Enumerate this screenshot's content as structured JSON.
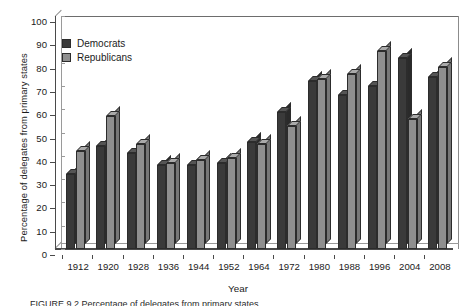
{
  "chart_data": {
    "type": "bar",
    "title": "",
    "xlabel": "Year",
    "ylabel": "Percentage of delegates from primary states",
    "categories": [
      "1912",
      "1920",
      "1928",
      "1936",
      "1944",
      "1952",
      "1964",
      "1972",
      "1980",
      "1988",
      "1996",
      "2004",
      "2008"
    ],
    "series": [
      {
        "name": "Democrats",
        "color": "#3a3a3a",
        "values": [
          32,
          44,
          41,
          36,
          36,
          37,
          46,
          59,
          72,
          66,
          70,
          82,
          74
        ]
      },
      {
        "name": "Republicans",
        "color": "#8f8f8f",
        "values": [
          42,
          57,
          45,
          37,
          38,
          39,
          45,
          53,
          73,
          75,
          85,
          56,
          78
        ]
      }
    ],
    "ylim": [
      0,
      100
    ],
    "yticks": [
      0,
      10,
      20,
      30,
      40,
      50,
      60,
      70,
      80,
      90,
      100
    ],
    "ytick_labels": [
      "0",
      "10",
      "20",
      "30",
      "40",
      "50",
      "60",
      "70",
      "80",
      "90",
      "100"
    ],
    "grid": false,
    "legend_position": "top-left",
    "style": "3d-bar"
  },
  "legend": {
    "items": [
      {
        "label": "Democrats"
      },
      {
        "label": "Republicans"
      }
    ]
  },
  "axes": {
    "x_title": "Year",
    "y_title": "Percentage of delegates from primary states"
  },
  "caption": {
    "text": "FIGURE 9.2  Percentage of delegates from primary states"
  }
}
